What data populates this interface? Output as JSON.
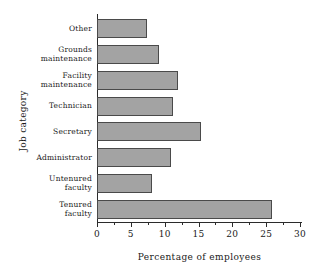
{
  "chart_data": {
    "type": "bar",
    "orientation": "horizontal",
    "title": "",
    "xlabel": "Percentage of employees",
    "ylabel": "Job category",
    "categories": [
      "Tenured faculty",
      "Untenured faculty",
      "Administrator",
      "Secretary",
      "Technician",
      "Facility maintenance",
      "Grounds maintenance",
      "Other"
    ],
    "category_lines": [
      [
        "Tenured",
        "faculty"
      ],
      [
        "Untenured",
        "faculty"
      ],
      [
        "Administrator"
      ],
      [
        "Secretary"
      ],
      [
        "Technician"
      ],
      [
        "Facility",
        "maintenance"
      ],
      [
        "Grounds",
        "maintenance"
      ],
      [
        "Other"
      ]
    ],
    "values": [
      25.8,
      8.2,
      11.0,
      15.4,
      11.3,
      12.0,
      9.2,
      7.4
    ],
    "xlim": [
      0,
      30
    ],
    "xticks": [
      0,
      5,
      10,
      15,
      20,
      25,
      30
    ],
    "xtick_labels": [
      "0",
      "5",
      "10",
      "15",
      "20",
      "25",
      "30"
    ],
    "minor_tick_step": 2.5,
    "grid": false,
    "legend": null,
    "bar_color": "#a3a3a3",
    "bar_edge_color": "#4a4a4a",
    "axis_color": "#2b2b2b",
    "background": "#ffffff"
  }
}
